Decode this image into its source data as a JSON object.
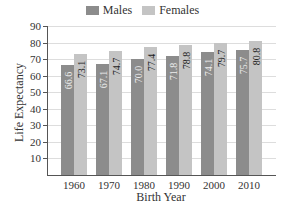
{
  "chart_data": {
    "type": "bar",
    "title": "",
    "xlabel": "Birth Year",
    "ylabel": "Life Expectancy",
    "categories": [
      "1960",
      "1970",
      "1980",
      "1990",
      "2000",
      "2010"
    ],
    "series": [
      {
        "name": "Males",
        "color": "#8c8c8c",
        "values": [
          66.6,
          67.1,
          70.0,
          71.8,
          74.1,
          75.7
        ]
      },
      {
        "name": "Females",
        "color": "#c4c4c4",
        "values": [
          73.1,
          74.7,
          77.4,
          78.8,
          79.7,
          80.8
        ]
      }
    ],
    "yticks": [
      10,
      20,
      30,
      40,
      50,
      60,
      70,
      80,
      90
    ],
    "ylim": [
      0,
      90
    ],
    "grid": true,
    "legend_position": "top"
  },
  "labels": {
    "males": "Males",
    "females": "Females",
    "xlabel": "Birth Year",
    "ylabel": "Life Expectancy"
  }
}
